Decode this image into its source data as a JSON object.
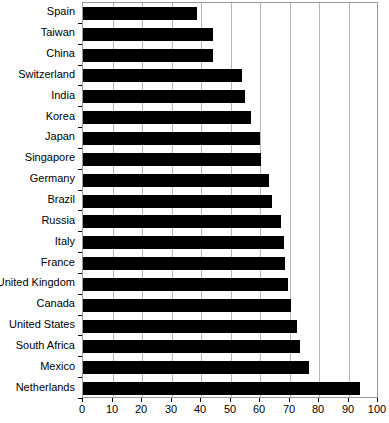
{
  "chart_data": {
    "type": "bar",
    "orientation": "horizontal",
    "title": "",
    "xlabel": "",
    "ylabel": "",
    "xlim": [
      0,
      100
    ],
    "xticks": [
      0,
      10,
      20,
      30,
      40,
      50,
      60,
      70,
      80,
      90,
      100
    ],
    "grid": "vertical",
    "legend": "none",
    "bar_color": "#000000",
    "categories": [
      "Spain",
      "Taiwan",
      "China",
      "Switzerland",
      "India",
      "Korea",
      "Japan",
      "Singapore",
      "Germany",
      "Brazil",
      "Russia",
      "Italy",
      "France",
      "United Kingdom",
      "Canada",
      "United States",
      "South Africa",
      "Mexico",
      "Netherlands"
    ],
    "values": [
      38.5,
      44,
      44,
      54,
      55,
      57,
      60,
      60.5,
      63,
      64,
      67,
      68,
      68.5,
      69.5,
      70.5,
      72.5,
      73.5,
      76.5,
      94
    ]
  }
}
